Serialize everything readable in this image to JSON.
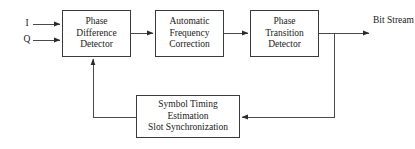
{
  "diagram": {
    "stroke_color": "#3a3a3a",
    "text_color": "#1a1a1a",
    "background_color": "#ffffff",
    "inputs": [
      {
        "id": "i",
        "label": "I"
      },
      {
        "id": "q",
        "label": "Q"
      }
    ],
    "outputs": [
      {
        "id": "bit_stream",
        "line1": "Bit",
        "line2": "Stream"
      }
    ],
    "blocks": [
      {
        "id": "phase_difference_detector",
        "line1": "Phase",
        "line2": "Difference",
        "line3": "Detector"
      },
      {
        "id": "automatic_frequency_correction",
        "line1": "Automatic",
        "line2": "Frequency",
        "line3": "Correction"
      },
      {
        "id": "phase_transition_detector",
        "line1": "Phase",
        "line2": "Transition",
        "line3": "Detector"
      },
      {
        "id": "symbol_timing_estimation",
        "line1": "Symbol Timing",
        "line2": "Estimation",
        "line3": "Slot Synchronization"
      }
    ],
    "connections": [
      {
        "id": "i-to-pdd",
        "from": "I",
        "to": "Phase Difference Detector"
      },
      {
        "id": "q-to-pdd",
        "from": "Q",
        "to": "Phase Difference Detector"
      },
      {
        "id": "pdd-to-afc",
        "from": "Phase Difference Detector",
        "to": "Automatic Frequency Correction"
      },
      {
        "id": "afc-to-ptd",
        "from": "Automatic Frequency Correction",
        "to": "Phase Transition Detector"
      },
      {
        "id": "ptd-to-output",
        "from": "Phase Transition Detector",
        "to": "Bit Stream"
      },
      {
        "id": "ptd-tap-to-ste",
        "from": "Phase Transition Detector",
        "to": "Symbol Timing Estimation Slot Synchronization"
      },
      {
        "id": "ste-to-pdd",
        "from": "Symbol Timing Estimation Slot Synchronization",
        "to": "Phase Difference Detector"
      }
    ]
  }
}
